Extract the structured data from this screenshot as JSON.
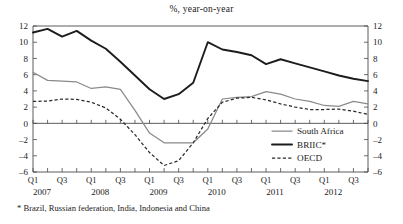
{
  "chart_data": {
    "type": "line",
    "title": "%, year-on-year",
    "xlabel": "",
    "ylabel": "",
    "ylim": [
      -6,
      12
    ],
    "yticks": [
      12,
      10,
      8,
      6,
      4,
      2,
      0,
      -2,
      -4,
      -6
    ],
    "ytick_labels": [
      "12",
      "10",
      "8",
      "6",
      "4",
      "2",
      "0",
      "–2",
      "–4",
      "–6"
    ],
    "right_axis": true,
    "right_ytick_labels": [
      "12",
      "10",
      "8",
      "6",
      "4",
      "2",
      "0",
      "–2",
      "–4",
      "–6"
    ],
    "grid": false,
    "legend_position": "bottom-right",
    "x": [
      "2007Q1",
      "2007Q2",
      "2007Q3",
      "2007Q4",
      "2008Q1",
      "2008Q2",
      "2008Q3",
      "2008Q4",
      "2009Q1",
      "2009Q2",
      "2009Q3",
      "2009Q4",
      "2010Q1",
      "2010Q2",
      "2010Q3",
      "2010Q4",
      "2011Q1",
      "2011Q2",
      "2011Q3",
      "2011Q4",
      "2012Q1",
      "2012Q2",
      "2012Q3",
      "2012Q4"
    ],
    "xtick_labels": [
      "Q1",
      "Q3",
      "Q1",
      "Q3",
      "Q1",
      "Q3",
      "Q1",
      "Q3",
      "Q1",
      "Q3",
      "Q1",
      "Q3"
    ],
    "xtick_positions": [
      "2007Q1",
      "2007Q3",
      "2008Q1",
      "2008Q3",
      "2009Q1",
      "2009Q3",
      "2010Q1",
      "2010Q3",
      "2011Q1",
      "2011Q3",
      "2012Q1",
      "2012Q3"
    ],
    "year_labels": [
      "2007",
      "2008",
      "2009",
      "2010",
      "2011",
      "2012"
    ],
    "series": [
      {
        "name": "South Africa",
        "style": "solid-thin-gray",
        "color": "#8a8a8a",
        "values": [
          6.3,
          5.3,
          5.2,
          5.1,
          4.3,
          4.5,
          4.2,
          1.6,
          -1.2,
          -2.4,
          -2.4,
          -2.4,
          -0.7,
          3.0,
          3.2,
          3.3,
          3.9,
          3.6,
          3.0,
          2.7,
          2.2,
          2.1,
          2.7,
          2.4
        ]
      },
      {
        "name": "BRIIC*",
        "style": "solid-thick-black",
        "color": "#1c1c1c",
        "values": [
          11.2,
          11.65,
          10.7,
          11.4,
          10.2,
          9.2,
          7.6,
          5.9,
          4.2,
          3.0,
          3.6,
          5.0,
          10.0,
          9.1,
          8.8,
          8.4,
          7.3,
          7.9,
          7.4,
          6.9,
          6.4,
          5.9,
          5.5,
          5.2
        ]
      },
      {
        "name": "OECD",
        "style": "dashed",
        "color": "#2a2a2a",
        "values": [
          2.7,
          2.75,
          3.0,
          2.95,
          2.6,
          1.9,
          0.5,
          -1.4,
          -3.6,
          -5.2,
          -4.6,
          -2.4,
          0.6,
          2.6,
          3.1,
          3.2,
          2.9,
          2.4,
          2.0,
          1.7,
          1.7,
          1.75,
          1.5,
          1.1
        ]
      }
    ],
    "legend": [
      {
        "label": "South Africa",
        "style": "solid-thin-gray"
      },
      {
        "label": "BRIIC*",
        "style": "solid-thick-black"
      },
      {
        "label": "OECD",
        "style": "dashed"
      }
    ],
    "annotations": [
      "* Brazil, Russian federation, India, Indonesia and China"
    ]
  },
  "footnote": "* Brazil, Russian federation, India, Indonesia and China"
}
